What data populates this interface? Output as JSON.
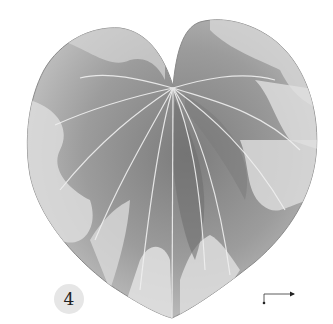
{
  "image": {
    "subject": "Botanical illustration of a heart-shaped variegated leaf (Cyclamen-style), rendered in grayscale",
    "colors": {
      "background": "#ffffff",
      "leaf_dark": "#6e6e6e",
      "leaf_mid": "#9a9a9a",
      "leaf_light": "#d8d8d8",
      "vein": "#f2f2f2",
      "badge_bg": "#e6e6e6"
    }
  },
  "figure_label": "4",
  "scale_bar": {
    "shape": "L-shaped scale marker with dot endpoints"
  }
}
